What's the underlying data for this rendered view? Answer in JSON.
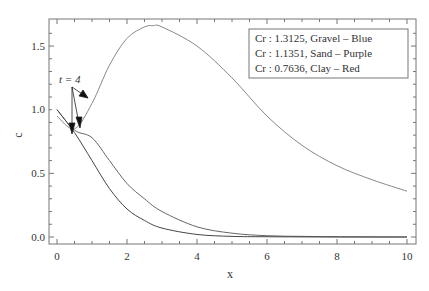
{
  "chart_data": {
    "type": "line",
    "title": "",
    "xlabel": "x",
    "ylabel": "c",
    "xlim": [
      -0.2,
      10.2
    ],
    "ylim": [
      -0.05,
      1.7
    ],
    "xticks": [
      "0",
      "2",
      "4",
      "6",
      "8",
      "10"
    ],
    "yticks": [
      "0.0",
      "0.5",
      "1.0",
      "1.5"
    ],
    "grid": false,
    "legend_position": "upper right",
    "legend": [
      "Cr : 1.3125, Gravel – Blue",
      "Cr : 1.1351, Sand – Purple",
      "Cr : 0.7636, Clay – Red"
    ],
    "annotation": "t = 4",
    "series": [
      {
        "name": "Cr : 1.3125, Gravel",
        "x": [
          0,
          0.5,
          1,
          1.5,
          2,
          2.5,
          2.75,
          3,
          4,
          5,
          6,
          7,
          8,
          9,
          10
        ],
        "values": [
          0.95,
          0.85,
          1.05,
          1.35,
          1.56,
          1.65,
          1.66,
          1.65,
          1.5,
          1.25,
          0.95,
          0.72,
          0.56,
          0.45,
          0.36
        ]
      },
      {
        "name": "Cr : 1.1351, Sand",
        "x": [
          0,
          0.5,
          1,
          1.5,
          2,
          2.5,
          3,
          4,
          5,
          6,
          7,
          8,
          10
        ],
        "values": [
          1.0,
          0.84,
          0.78,
          0.6,
          0.42,
          0.3,
          0.2,
          0.08,
          0.03,
          0.01,
          0.005,
          0.002,
          0.0
        ]
      },
      {
        "name": "Cr : 0.7636, Clay",
        "x": [
          0,
          0.5,
          1,
          1.5,
          2,
          2.5,
          3,
          4,
          5,
          6,
          8,
          10
        ],
        "values": [
          1.0,
          0.82,
          0.6,
          0.38,
          0.22,
          0.13,
          0.07,
          0.02,
          0.005,
          0.002,
          0.0,
          0.0
        ]
      }
    ]
  }
}
